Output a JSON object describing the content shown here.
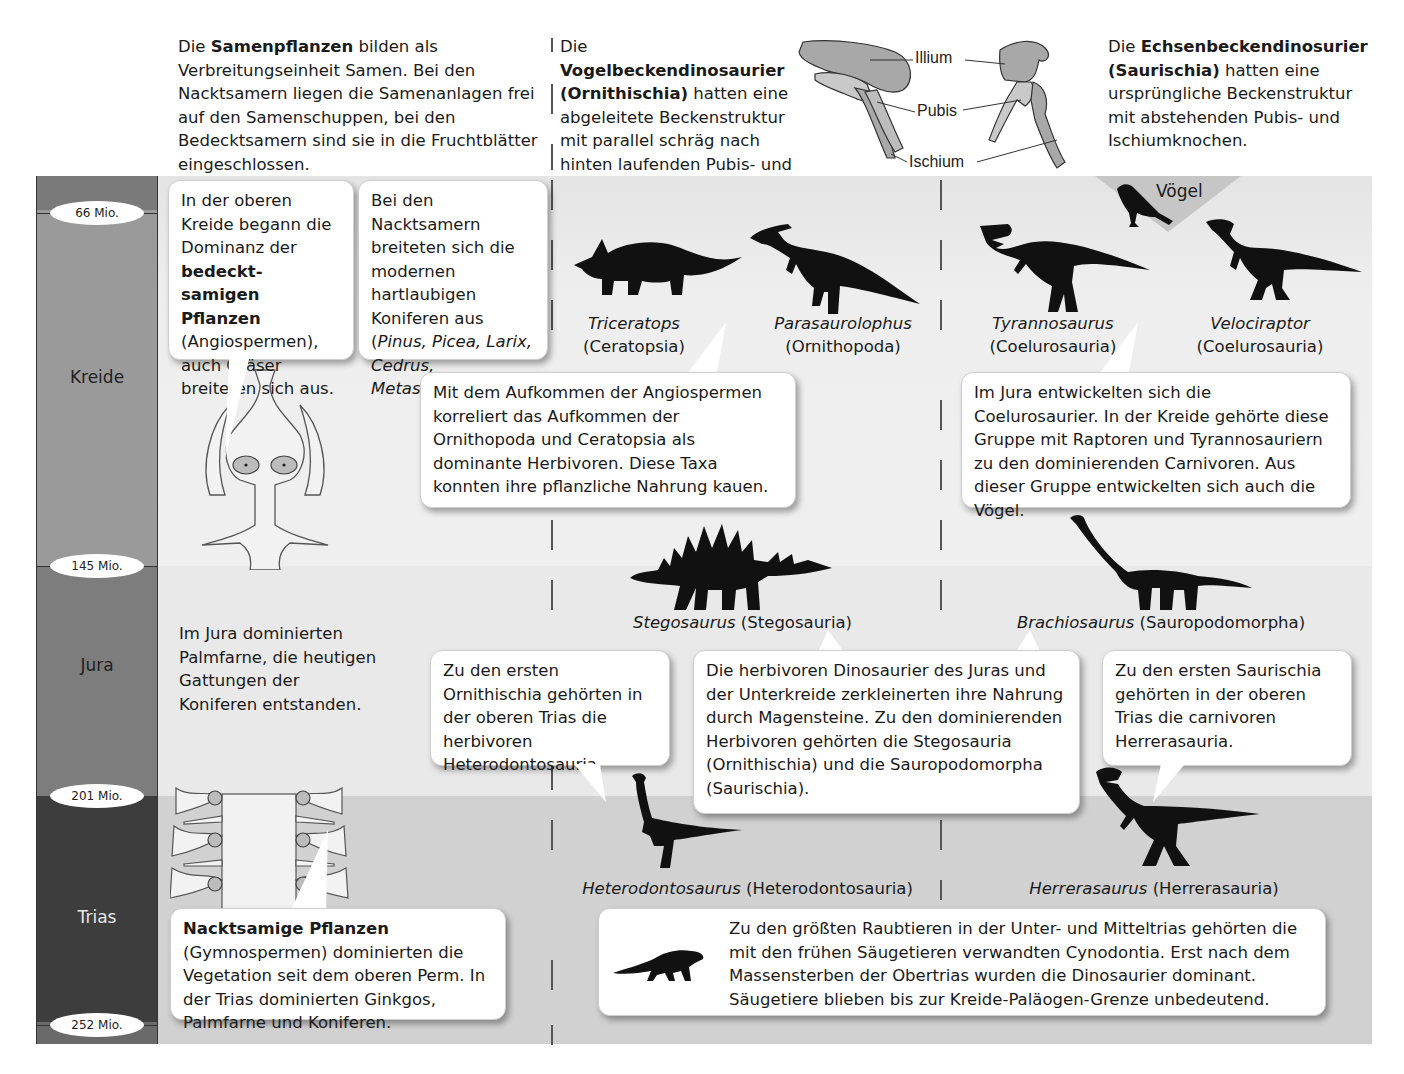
{
  "header": {
    "seed_plants": {
      "pre": "Die ",
      "bold": "Samenpflanzen",
      "post": " bilden als Verbreitungseinheit Samen. Bei den Nacktsamern liegen die Samenanlagen frei auf den Samenschuppen, bei den Bedecktsamern sind sie in die Fruchtblätter eingeschlossen."
    },
    "ornithischia": {
      "pre": "Die ",
      "bold": "Vogelbeckendinosaurier (Ornithischia)",
      "post": " hatten eine abgeleitete Beckenstruktur mit parallel schräg nach hinten laufenden Pubis- und Ischiumknochen."
    },
    "saurischia": {
      "pre": "Die ",
      "bold": "Echsenbeckendinosurier (Saurischia)",
      "post": " hatten eine ursprüngliche Beckenstruktur mit abstehenden Pubis- und Ischiumknochen."
    },
    "pelvis_labels": {
      "illium": "Illium",
      "pubis": "Pubis",
      "ischium": "Ischium"
    }
  },
  "timeline": {
    "periods": [
      {
        "name": "Kreide"
      },
      {
        "name": "Jura"
      },
      {
        "name": "Trias"
      }
    ],
    "boundaries": [
      "66 Mio.",
      "145 Mio.",
      "201 Mio.",
      "252 Mio."
    ]
  },
  "kreide": {
    "bubble_angiosperms": {
      "pre": "In der oberen Kreide begann die Dominanz der ",
      "bold": "bedeckt-samigen Pflanzen",
      "post": " (Angiospermen), auch Gräser breiteten sich aus."
    },
    "bubble_conifers": {
      "pre": "Bei den Nacktsamern breiteten sich die modernen hartlaubigen Koniferen aus (",
      "italic": "Pinus, Picea, Larix, Cedrus, Metasequoia",
      "post": ")."
    },
    "birds_label": "Vögel",
    "dinos": [
      {
        "genus": "Triceratops",
        "group": "(Ceratopsia)"
      },
      {
        "genus": "Parasaurolophus",
        "group": "(Ornithopoda)"
      },
      {
        "genus": "Tyrannosaurus",
        "group": "(Coelurosauria)"
      },
      {
        "genus": "Velociraptor",
        "group": "(Coelurosauria)"
      }
    ],
    "bubble_herbivores": "Mit dem Aufkommen der Angiospermen korreliert das Aufkommen der Ornithopoda und Ceratopsia als dominante Herbivoren. Diese Taxa konnten ihre pflanzliche Nahrung kauen.",
    "bubble_coelurosaurs": "Im Jura entwickelten sich die Coelurosaurier. In der Kreide gehörte diese Gruppe mit Raptoren und Tyrannosauriern zu den dominierenden Carnivoren. Aus dieser Gruppe entwickelten sich auch die Vögel."
  },
  "jura": {
    "plants_text": "Im Jura dominierten Palmfarne, die heutigen Gattungen der Koniferen entstanden.",
    "dinos": [
      {
        "genus": "Stegosaurus",
        "group": " (Stegosauria)"
      },
      {
        "genus": "Brachiosaurus",
        "group": " (Sauropodomorpha)"
      }
    ],
    "bubble_first_ornithischia": "Zu den ersten Ornithischia gehörten in der oberen Trias die herbivoren Heterodontosauria.",
    "bubble_gastroliths": "Die herbivoren Dinosaurier des Juras und der Unterkreide zerkleinerten ihre Nahrung durch Magensteine. Zu den dominierenden Herbivoren gehörten die Stegosauria (Ornithischia) und die Sauropodomorpha (Saurischia).",
    "bubble_first_saurischia": "Zu den ersten Saurischia gehörten in der oberen Trias die carnivoren Herrerasauria."
  },
  "trias": {
    "dinos": [
      {
        "genus": "Heterodontosaurus",
        "group": " (Heterodontosauria)"
      },
      {
        "genus": "Herrerasaurus",
        "group": " (Herrerasauria)"
      }
    ],
    "bubble_gymnosperms": {
      "bold": "Nacktsamige Pflanzen",
      "post": " (Gymnospermen) dominierten die Vegetation seit dem oberen Perm. In der Trias dominierten Ginkgos, Palmfarne und Koniferen."
    },
    "bubble_cynodontia": "Zu den größten Raubtieren in der Unter- und Mitteltrias gehörten die mit den frühen Säugetieren verwandten Cynodontia. Erst nach dem Massensterben der Obertrias wurden die Dinosaurier dominant. Säugetiere blieben bis zur Kreide-Paläogen-Grenze unbedeutend."
  },
  "colors": {
    "silhouette": "#111111",
    "bone_fill": "#a8a8a8",
    "band_kreide": "#ececec",
    "band_jura": "#e9e9e9",
    "band_trias": "#d1d1d1",
    "col_kreide": "#9a9a9a",
    "col_jura": "#7d7d7d",
    "col_trias": "#3d3d3d"
  }
}
